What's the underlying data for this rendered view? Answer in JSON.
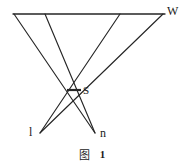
{
  "figure": {
    "caption_word": "图",
    "caption_number": "1",
    "labels": {
      "wavefront": "W",
      "slit": "S",
      "left_focus": "l",
      "right_focus": "n"
    },
    "colors": {
      "ink": "#262626",
      "background": "#ffffff"
    },
    "geometry": {
      "wavefront_line": {
        "x1": 13,
        "y1": 14,
        "x2": 165,
        "y2": 14
      },
      "slit_bar": {
        "x1": 67,
        "y1": 90,
        "x2": 81,
        "y2": 90
      },
      "slit_point": {
        "x": 74,
        "y": 90
      },
      "left_focus_point": {
        "x": 40,
        "y": 133
      },
      "right_focus_point": {
        "x": 95,
        "y": 133
      },
      "rays": [
        {
          "name": "ray-w-left-outer",
          "x1": 14,
          "y1": 14,
          "x2": 95,
          "y2": 133
        },
        {
          "name": "ray-w-left-inner",
          "x1": 45,
          "y1": 14,
          "x2": 95,
          "y2": 133
        },
        {
          "name": "ray-w-right-inner",
          "x1": 120,
          "y1": 14,
          "x2": 40,
          "y2": 133
        },
        {
          "name": "ray-w-right-outer",
          "x1": 163,
          "y1": 14,
          "x2": 40,
          "y2": 133
        }
      ]
    }
  }
}
